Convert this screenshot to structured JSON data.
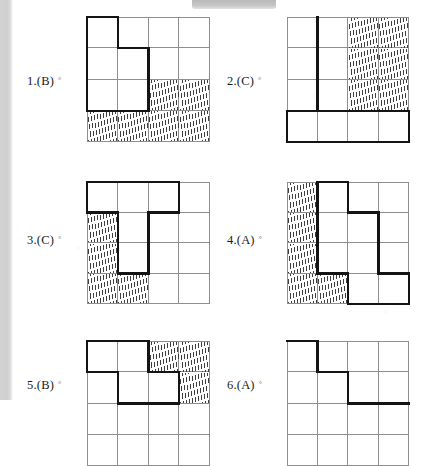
{
  "page": {
    "type": "worksheet-answer-key",
    "grid_rows": 4,
    "grid_cols": 4,
    "ink_color": "#141414",
    "grid_line_color": "#8e8e8e",
    "hatch_color": "#3f3f3f"
  },
  "items": [
    {
      "id": "item-1",
      "number": "1.",
      "answer": "(B)",
      "label": "1.(B)",
      "marker": "°",
      "hatched_cells": [
        [
          2,
          2
        ],
        [
          2,
          3
        ],
        [
          3,
          0
        ],
        [
          3,
          1
        ],
        [
          3,
          2
        ],
        [
          3,
          3
        ]
      ],
      "bold_path": "M0,0 H1 V1 H2 V3 H0 Z"
    },
    {
      "id": "item-2",
      "number": "2.",
      "answer": "(C)",
      "label": "2.(C)",
      "marker": "°",
      "hatched_cells": [
        [
          0,
          2
        ],
        [
          0,
          3
        ],
        [
          1,
          2
        ],
        [
          1,
          3
        ],
        [
          2,
          2
        ],
        [
          2,
          3
        ]
      ],
      "bold_path": "M1,0 V3 H0 V4 H4 V3 H1 Z"
    },
    {
      "id": "item-3",
      "number": "3.",
      "answer": "(C)",
      "label": "3.(C)",
      "marker": "°",
      "hatched_cells": [
        [
          1,
          0
        ],
        [
          2,
          0
        ],
        [
          3,
          0
        ],
        [
          3,
          1
        ]
      ],
      "bold_path": "M0,0 H3 V1 H2 V3 H1 V1 H0 Z"
    },
    {
      "id": "item-4",
      "number": "4.",
      "answer": "(A)",
      "label": "4.(A)",
      "marker": "°",
      "hatched_cells": [
        [
          0,
          0
        ],
        [
          1,
          0
        ],
        [
          2,
          0
        ],
        [
          3,
          0
        ],
        [
          3,
          1
        ]
      ],
      "bold_path": "M1,0 H2 V1 H3 V3 H4 V4 H2 V3 H1 Z"
    },
    {
      "id": "item-5",
      "number": "5.",
      "answer": "(B)",
      "label": "5.(B)",
      "marker": "°",
      "hatched_cells": [
        [
          0,
          2
        ],
        [
          0,
          3
        ],
        [
          1,
          3
        ]
      ],
      "bold_path": "M0,0 H2 V1 H3 V2 H1 V1 H0 Z"
    },
    {
      "id": "item-6",
      "number": "6.",
      "answer": "(A)",
      "label": "6.(A)",
      "marker": "°",
      "hatched_cells": [],
      "bold_path": "M0,0 H1 V1 H2 V2 H4"
    }
  ]
}
